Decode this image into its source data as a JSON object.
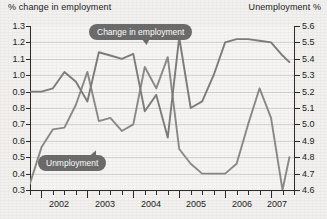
{
  "chart_data": {
    "type": "line",
    "title": "",
    "left_axis": {
      "label": "% change in employment",
      "ticks": [
        "1.3",
        "1.2",
        "1.1",
        "1.0",
        "0.9",
        "0.8",
        "0.7",
        "0.6",
        "0.5",
        "0.4",
        "0.3"
      ],
      "ylim": [
        0.3,
        1.3
      ]
    },
    "right_axis": {
      "label": "Unemployment %",
      "ticks": [
        "5.6",
        "5.5",
        "5.4",
        "5.3",
        "5.2",
        "5.1",
        "5.0",
        "4.9",
        "4.8",
        "4.7",
        "4.6"
      ],
      "ylim": [
        4.6,
        5.6
      ]
    },
    "xlabel": "",
    "xlim": [
      2001.75,
      2007.5
    ],
    "x_tick_labels": [
      "2002",
      "2003",
      "2004",
      "2005",
      "2006",
      "2007"
    ],
    "x_tick_positions": [
      2002.375,
      2003.375,
      2004.375,
      2005.375,
      2006.375,
      2007.125
    ],
    "x_major_ticks": [
      2002.0,
      2003.0,
      2004.0,
      2005.0,
      2006.0,
      2007.0
    ],
    "grid": true,
    "legend_position": "inline-callout",
    "series": [
      {
        "name": "Change in employment",
        "axis": "left",
        "color": "#7d7d7d",
        "x": [
          2001.75,
          2002.0,
          2002.25,
          2002.5,
          2002.75,
          2003.0,
          2003.25,
          2003.5,
          2003.75,
          2004.0,
          2004.25,
          2004.5,
          2004.75,
          2005.0,
          2005.25,
          2005.5,
          2005.75,
          2006.0,
          2006.25,
          2006.5,
          2006.75,
          2007.0,
          2007.25,
          2007.4
        ],
        "values": [
          0.9,
          0.9,
          0.92,
          1.02,
          0.96,
          0.84,
          1.14,
          1.12,
          1.1,
          1.13,
          0.78,
          0.88,
          0.62,
          1.23,
          0.8,
          0.84,
          1.0,
          1.2,
          1.22,
          1.22,
          1.21,
          1.2,
          1.12,
          1.08
        ]
      },
      {
        "name": "Unmployment",
        "axis": "right",
        "color": "#8a8a8a",
        "x": [
          2001.75,
          2002.0,
          2002.25,
          2002.5,
          2002.75,
          2003.0,
          2003.25,
          2003.5,
          2003.75,
          2004.0,
          2004.25,
          2004.5,
          2004.75,
          2005.0,
          2005.25,
          2005.5,
          2005.75,
          2006.0,
          2006.25,
          2006.5,
          2006.75,
          2007.0,
          2007.25,
          2007.4
        ],
        "values": [
          4.64,
          4.86,
          4.97,
          4.98,
          5.12,
          5.32,
          5.02,
          5.04,
          4.96,
          5.0,
          5.35,
          5.22,
          5.41,
          4.85,
          4.76,
          4.7,
          4.7,
          4.7,
          4.76,
          5.0,
          5.22,
          5.04,
          4.6,
          4.8
        ]
      }
    ],
    "annotations": [
      {
        "name": "employment-callout",
        "text": "Change in employment"
      },
      {
        "name": "unemployment-callout",
        "text": "Unmployment"
      }
    ]
  }
}
